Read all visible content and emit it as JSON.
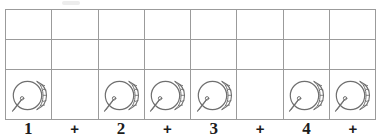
{
  "document": {
    "kind": "rhythm-notation-worksheet",
    "measure_count": 1,
    "subdivision": "eighth-notes",
    "icon_name": "drum-icon"
  },
  "grid": {
    "column_count": 8,
    "row_count": 3,
    "rows": [
      {
        "name": "upper-blank-row",
        "cells": [
          {
            "content": ""
          },
          {
            "content": ""
          },
          {
            "content": ""
          },
          {
            "content": ""
          },
          {
            "content": ""
          },
          {
            "content": ""
          },
          {
            "content": ""
          },
          {
            "content": ""
          }
        ]
      },
      {
        "name": "middle-blank-row",
        "cells": [
          {
            "content": ""
          },
          {
            "content": ""
          },
          {
            "content": ""
          },
          {
            "content": ""
          },
          {
            "content": ""
          },
          {
            "content": ""
          },
          {
            "content": ""
          },
          {
            "content": ""
          }
        ]
      },
      {
        "name": "drum-icon-row",
        "cells": [
          {
            "content": "drum-icon"
          },
          {
            "content": ""
          },
          {
            "content": "drum-icon"
          },
          {
            "content": "drum-icon"
          },
          {
            "content": "drum-icon"
          },
          {
            "content": ""
          },
          {
            "content": "drum-icon"
          },
          {
            "content": "drum-icon"
          }
        ]
      }
    ]
  },
  "beat_labels": [
    {
      "text": "1",
      "type": "beat"
    },
    {
      "text": "+",
      "type": "and"
    },
    {
      "text": "2",
      "type": "beat"
    },
    {
      "text": "+",
      "type": "and"
    },
    {
      "text": "3",
      "type": "beat"
    },
    {
      "text": "+",
      "type": "and"
    },
    {
      "text": "4",
      "type": "beat"
    },
    {
      "text": "+",
      "type": "and"
    }
  ],
  "colors": {
    "grid_line": "#9b9b9b",
    "icon_stroke": "#6f6f6f",
    "text": "#1c1c1c",
    "background": "#ffffff"
  }
}
